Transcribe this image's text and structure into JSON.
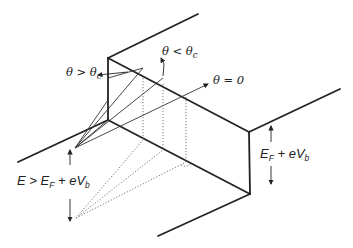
{
  "diagram": {
    "title": "",
    "labels": {
      "theta_gt": {
        "main": "θ > θ",
        "sub": "c"
      },
      "theta_lt": {
        "main": "θ < θ",
        "sub": "c"
      },
      "theta_zero": {
        "main": "θ = 0"
      },
      "energy_left": {
        "pre": "E > E",
        "sub1": "F",
        "mid": " + eV",
        "sub2": "b"
      },
      "energy_right": {
        "pre": "E",
        "sub1": "F",
        "mid": " + eV",
        "sub2": "b"
      }
    },
    "colors": {
      "line": "#222222",
      "background": "#ffffff"
    }
  }
}
